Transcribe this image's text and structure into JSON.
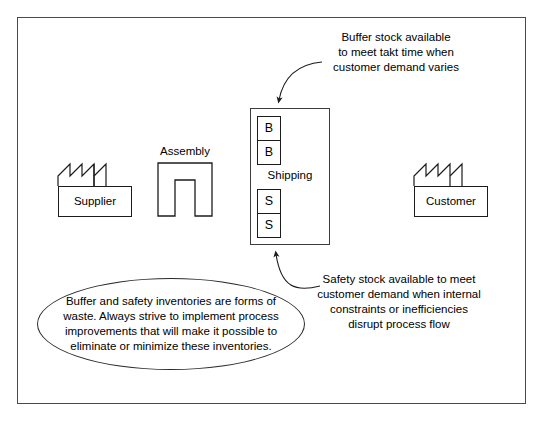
{
  "diagram": {
    "title_hidden": "",
    "frame": {
      "border_color": "#4a4a4a"
    },
    "annotations": {
      "buffer": "Buffer stock available\nto meet takt time when\ncustomer demand varies",
      "safety": "Safety stock available to meet\ncustomer demand when internal\nconstraints or inefficiencies\ndisrupt process flow",
      "note_ellipse": "Buffer and safety inventories are forms\nof waste. Always strive to implement process\nimprovements that will make it possible to\neliminate or minimize these inventories."
    },
    "nodes": {
      "supplier": {
        "label": "Supplier",
        "icon": "factory-icon"
      },
      "assembly": {
        "label": "Assembly",
        "icon": "u-cell-icon"
      },
      "customer": {
        "label": "Customer",
        "icon": "factory-icon"
      },
      "shipping": {
        "label": "Shipping"
      }
    },
    "stock_cells": {
      "buffer": [
        "B",
        "B"
      ],
      "safety": [
        "S",
        "S"
      ]
    },
    "colors": {
      "line": "#1c1c1c",
      "frame": "#4a4a4a",
      "background": "#ffffff",
      "text": "#000000"
    }
  }
}
